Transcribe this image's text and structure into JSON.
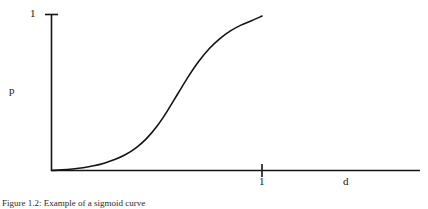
{
  "figure": {
    "caption": "Figure 1.2:  Example of a sigmoid curve",
    "background_color": "#ffffff",
    "line_color": "#141414"
  },
  "axes": {
    "y_label": "p",
    "x_label": "d",
    "y_tick_label": "1",
    "x_tick_label": "1"
  },
  "chart_data": {
    "type": "line",
    "title": "",
    "subtitle": "",
    "xlabel": "d",
    "ylabel": "p",
    "xlim": [
      0,
      2.1
    ],
    "ylim": [
      0,
      1.08
    ],
    "grid": false,
    "legend": null,
    "x_ticks": [
      1
    ],
    "x_tick_labels": [
      "1"
    ],
    "y_ticks": [
      1
    ],
    "y_tick_labels": [
      "1"
    ],
    "annotations": [],
    "series": [
      {
        "name": "sigmoid probability",
        "x": [
          0.0,
          0.05,
          0.1,
          0.15,
          0.2,
          0.25,
          0.3,
          0.35,
          0.4,
          0.45,
          0.5,
          0.55,
          0.6,
          0.65,
          0.7,
          0.75,
          0.8,
          0.85,
          0.9,
          0.95,
          1.0
        ],
        "y": [
          0.0,
          0.004,
          0.01,
          0.018,
          0.03,
          0.047,
          0.07,
          0.101,
          0.144,
          0.203,
          0.282,
          0.381,
          0.492,
          0.602,
          0.7,
          0.782,
          0.846,
          0.895,
          0.932,
          0.96,
          0.99
        ]
      }
    ]
  }
}
